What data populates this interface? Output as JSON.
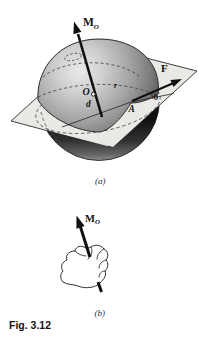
{
  "figure": {
    "caption": "Fig. 3.12",
    "colors": {
      "background": "#ffffff",
      "plane_fill": "#eae9e5",
      "sphere_highlight": "#e9e9e9",
      "sphere_dark": "#3f3f3f",
      "cap_dark": "#141414",
      "line": "#1a1a1a"
    },
    "part_a": {
      "tag": "(a)",
      "labels": {
        "moment_main": "M",
        "moment_sub": "O",
        "force": "F",
        "origin": "O",
        "distance": "d",
        "point": "A",
        "angle": "θ",
        "radius": "r"
      }
    },
    "part_b": {
      "tag": "(b)",
      "labels": {
        "moment_main": "M",
        "moment_sub": "O"
      }
    }
  }
}
